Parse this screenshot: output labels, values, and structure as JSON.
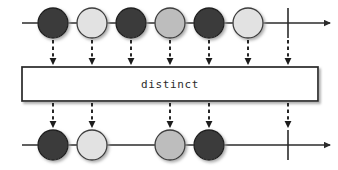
{
  "diagram": {
    "kind": "marble-diagram",
    "operator_label": "distinct",
    "width": 338,
    "height": 170,
    "background": "#ffffff",
    "palette": {
      "dark": "#3a3a3a",
      "light": "#e2e2e2",
      "medium": "#bdbdbd",
      "stroke": "#2b2b2b",
      "box_fill": "#ffffff",
      "box_stroke": "#262626",
      "shadow": "#b4b4b4"
    }
  },
  "source_timeline": {
    "name": "source-observable",
    "axis_y": 23,
    "line_start_x": 22,
    "line_end_x": 330,
    "arrow_x": 330,
    "complete_bar_x": 288,
    "marble_radius": 15,
    "marbles": [
      {
        "index": 1,
        "x": 53,
        "value": "a",
        "shade": "dark",
        "color": "#3a3a3a"
      },
      {
        "index": 2,
        "x": 92,
        "value": "b",
        "shade": "light",
        "color": "#e2e2e2"
      },
      {
        "index": 3,
        "x": 131,
        "value": "a",
        "shade": "dark",
        "color": "#3a3a3a"
      },
      {
        "index": 4,
        "x": 170,
        "value": "c",
        "shade": "medium",
        "color": "#bdbdbd"
      },
      {
        "index": 5,
        "x": 209,
        "value": "a",
        "shade": "dark",
        "color": "#3a3a3a"
      },
      {
        "index": 6,
        "x": 248,
        "value": "b",
        "shade": "light",
        "color": "#e2e2e2"
      }
    ]
  },
  "operator_box": {
    "name": "distinct-operator-box",
    "label": "distinct",
    "x": 22,
    "y": 67,
    "width": 296,
    "height": 34
  },
  "result_timeline": {
    "name": "result-observable",
    "axis_y": 145,
    "line_start_x": 22,
    "line_end_x": 330,
    "arrow_x": 330,
    "complete_bar_x": 288,
    "marble_radius": 15,
    "marbles": [
      {
        "index": 1,
        "x": 53,
        "value": "a",
        "shade": "dark",
        "color": "#3a3a3a"
      },
      {
        "index": 2,
        "x": 92,
        "value": "b",
        "shade": "light",
        "color": "#e2e2e2"
      },
      {
        "index": 3,
        "x": 170,
        "value": "c",
        "shade": "medium",
        "color": "#bdbdbd"
      },
      {
        "index": 4,
        "x": 209,
        "value": "a",
        "shade": "dark",
        "color": "#3a3a3a"
      }
    ]
  },
  "input_arrows": {
    "name": "input-dashed-arrows",
    "from_y": 40,
    "to_y": 65,
    "xs": [
      53,
      92,
      131,
      170,
      209,
      248,
      288
    ]
  },
  "output_arrows": {
    "name": "output-dashed-arrows",
    "from_y": 103,
    "to_y": 128,
    "xs": [
      53,
      92,
      170,
      209,
      288
    ]
  }
}
